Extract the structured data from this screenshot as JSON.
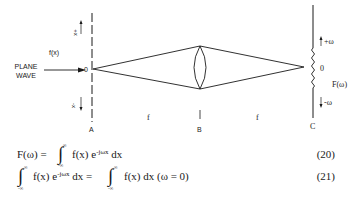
{
  "diagram": {
    "input_label": "f(x)",
    "plane_wave_line1": "PLANE",
    "plane_wave_line2": "WAVE",
    "origin_A": "0",
    "origin_C": "0",
    "plus_x": "+x",
    "minus_x": "-x",
    "plus_omega": "+ω",
    "minus_omega": "-ω",
    "output_label": "F(ω)",
    "plane_A": "A",
    "plane_B": "B",
    "plane_C": "C",
    "focal_1": "f",
    "focal_2": "f",
    "line_color": "#1a1a1a"
  },
  "equations": [
    {
      "lhs": "F(ω) =",
      "upper": "∞",
      "lower": "-∞",
      "integrand": "f(x) e",
      "exponent": "-jωx",
      "tail": " dx",
      "number": "(20)"
    },
    {
      "upper": "∞",
      "lower": "-∞",
      "integrand": "f(x) e",
      "exponent": "-jωx",
      "mid": " dx = ",
      "upper2": "∞",
      "lower2": "-∞",
      "rhs": "f(x) dx (ω = 0)",
      "number": "(21)"
    }
  ]
}
